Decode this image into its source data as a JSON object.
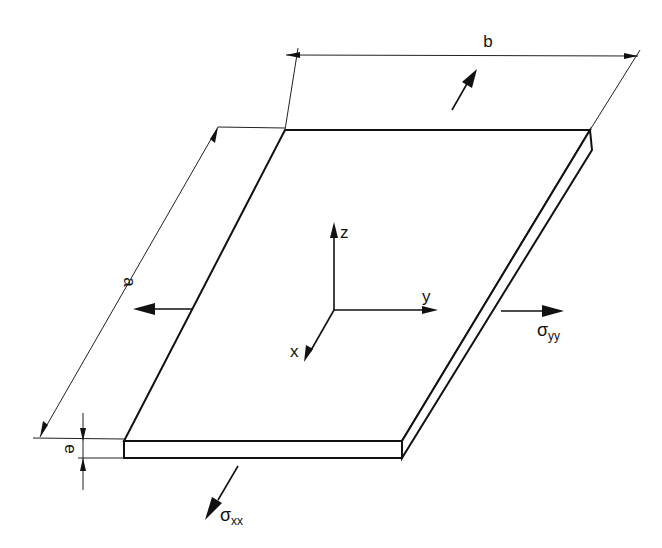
{
  "figure": {
    "dimensions": {
      "length_label": "a",
      "width_label": "b",
      "thickness_label": "e"
    },
    "axes": {
      "x_label": "x",
      "y_label": "y",
      "z_label": "z"
    },
    "stresses": {
      "normal_x": {
        "symbol": "σ",
        "subscript": "xx"
      },
      "normal_y": {
        "symbol": "σ",
        "subscript": "yy"
      }
    },
    "colors": {
      "line": "#111111",
      "background": "#ffffff"
    }
  }
}
